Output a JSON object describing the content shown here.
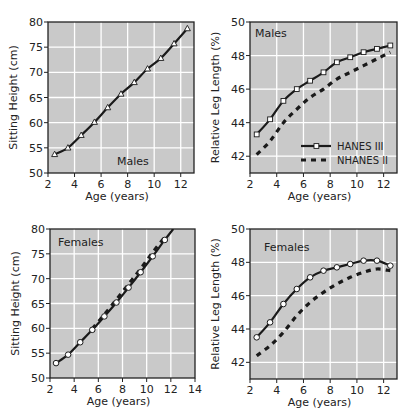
{
  "colors": {
    "plot_bg": "#c9c9c9",
    "grid": "#ffffff",
    "line": "#1a1a1a",
    "marker_fill": "#ffffff"
  },
  "legend": {
    "entries": [
      {
        "label": "HANES   III",
        "style": "solid-marker"
      },
      {
        "label": "NHANES II",
        "style": "dashed"
      }
    ]
  },
  "chart_data": [
    {
      "id": "males-sitting-height",
      "type": "line",
      "panel_label": "Males",
      "xlabel": "Age (years)",
      "ylabel": "Sitting Height (cm)",
      "xlim": [
        2,
        13
      ],
      "ylim": [
        50,
        80
      ],
      "xticks": [
        2,
        4,
        6,
        8,
        10,
        12
      ],
      "yticks": [
        50,
        55,
        60,
        65,
        70,
        75,
        80
      ],
      "grid": true,
      "marker": "triangle",
      "series": [
        {
          "name": "HANES III",
          "style": "solid",
          "x": [
            2.5,
            3.5,
            4.5,
            5.5,
            6.5,
            7.5,
            8.5,
            9.5,
            10.5,
            11.5,
            12.5
          ],
          "values": [
            53.7,
            55.0,
            57.5,
            60.1,
            63.0,
            65.7,
            68.0,
            70.7,
            72.8,
            75.7,
            78.7
          ]
        }
      ]
    },
    {
      "id": "males-relative-leg-length",
      "type": "line",
      "panel_label": "Males",
      "xlabel": "Age (years)",
      "ylabel": "Relative Leg Length (%)",
      "xlim": [
        2,
        13
      ],
      "ylim": [
        41,
        50
      ],
      "xticks": [
        2,
        4,
        6,
        8,
        10,
        12
      ],
      "yticks": [
        42,
        44,
        46,
        48,
        50
      ],
      "grid": true,
      "legend_position": "lower right",
      "series": [
        {
          "name": "HANES III",
          "style": "solid",
          "marker": "square",
          "x": [
            2.5,
            3.5,
            4.5,
            5.5,
            6.5,
            7.5,
            8.5,
            9.5,
            10.5,
            11.5,
            12.5
          ],
          "values": [
            43.3,
            44.2,
            45.3,
            46.0,
            46.5,
            47.0,
            47.6,
            47.9,
            48.2,
            48.4,
            48.6
          ]
        },
        {
          "name": "NHANES II",
          "style": "dashed",
          "x": [
            2.5,
            3.5,
            4.5,
            5.5,
            6.5,
            7.5,
            8.5,
            9.5,
            10.5,
            11.5,
            12.5
          ],
          "values": [
            42.1,
            42.9,
            44.0,
            44.8,
            45.5,
            46.0,
            46.6,
            47.0,
            47.4,
            47.8,
            48.2
          ]
        }
      ]
    },
    {
      "id": "females-sitting-height",
      "type": "line",
      "panel_label": "Females",
      "xlabel": "Age (years)",
      "ylabel": "Sitting Height (cm)",
      "xlim": [
        2,
        14
      ],
      "ylim": [
        50,
        80
      ],
      "xticks": [
        2,
        4,
        6,
        8,
        10,
        12,
        14
      ],
      "yticks": [
        50,
        55,
        60,
        65,
        70,
        75,
        80
      ],
      "grid": true,
      "marker": "circle",
      "series": [
        {
          "name": "HANES III",
          "style": "solid",
          "x": [
            2.5,
            3.5,
            4.5,
            5.5,
            6.5,
            7.5,
            8.5,
            9.5,
            10.5,
            11.5,
            12.2
          ],
          "values": [
            53.0,
            54.7,
            57.2,
            59.7,
            62.4,
            65.2,
            68.2,
            71.3,
            74.5,
            77.8,
            80.0
          ]
        },
        {
          "name": "NHANES II",
          "style": "dashed",
          "x": [
            5.5,
            6.5,
            7.5,
            8.5,
            9.5,
            10.5,
            11.5
          ],
          "values": [
            59.9,
            62.8,
            65.8,
            68.9,
            72.0,
            75.3,
            78.4
          ]
        }
      ]
    },
    {
      "id": "females-relative-leg-length",
      "type": "line",
      "panel_label": "Females",
      "xlabel": "Age (years)",
      "ylabel": "Relative Leg Length (%)",
      "xlim": [
        2,
        13
      ],
      "ylim": [
        41,
        50
      ],
      "xticks": [
        2,
        4,
        6,
        8,
        10,
        12
      ],
      "yticks": [
        42,
        44,
        46,
        48,
        50
      ],
      "grid": true,
      "series": [
        {
          "name": "HANES III",
          "style": "solid",
          "marker": "circle",
          "x": [
            2.5,
            3.5,
            4.5,
            5.5,
            6.5,
            7.5,
            8.5,
            9.5,
            10.5,
            11.5,
            12.5
          ],
          "values": [
            43.5,
            44.4,
            45.5,
            46.4,
            47.1,
            47.5,
            47.7,
            47.9,
            48.1,
            48.1,
            47.8
          ]
        },
        {
          "name": "NHANES II",
          "style": "dashed",
          "x": [
            2.5,
            3.5,
            4.5,
            5.5,
            6.5,
            7.5,
            8.5,
            9.5,
            10.5,
            11.5,
            12.5
          ],
          "values": [
            42.4,
            43.0,
            43.8,
            44.8,
            45.6,
            46.2,
            46.7,
            47.1,
            47.4,
            47.6,
            47.5
          ]
        }
      ]
    }
  ],
  "layout": {
    "panels": [
      {
        "left": 48,
        "top": 22,
        "width": 146,
        "height": 151
      },
      {
        "left": 250,
        "top": 22,
        "width": 147,
        "height": 151
      },
      {
        "left": 50,
        "top": 229,
        "width": 145,
        "height": 149
      },
      {
        "left": 250,
        "top": 229,
        "width": 147,
        "height": 150
      }
    ]
  }
}
